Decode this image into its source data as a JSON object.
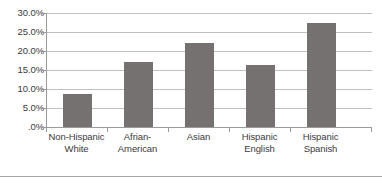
{
  "chart_data": {
    "type": "bar",
    "title": "",
    "subtitle": "",
    "xlabel": "",
    "ylabel": "",
    "categories": [
      "Non-Hispanic White",
      "Afrian-American",
      "Asian",
      "Hispanic English",
      "Hispanic Spanish"
    ],
    "category_lines": [
      [
        "Non-Hispanic",
        "White"
      ],
      [
        "Afrian-",
        "American"
      ],
      [
        "Asian",
        ""
      ],
      [
        "Hispanic",
        "English"
      ],
      [
        "Hispanic",
        "Spanish"
      ]
    ],
    "values": [
      8.7,
      17.0,
      22.0,
      16.2,
      27.5
    ],
    "value_labels": [
      "8.7%",
      "17.0%",
      "22.0%",
      "16.2%",
      "27.5%"
    ],
    "ylim": [
      0,
      30
    ],
    "ytick_values": [
      30,
      25,
      20,
      15,
      10,
      5,
      0
    ],
    "ytick_labels": [
      "30.0%",
      "25.0%",
      "20.0%",
      "15.0%",
      "10.0%",
      "5.0%",
      ".0%"
    ],
    "grid": true,
    "grid_axis": "y",
    "legend": false,
    "legend_position": "none",
    "bar_color": "#767171",
    "gridline_color": "#bfbfbf",
    "axis_color": "#9a9a9a",
    "text_color": "#3b3b3b",
    "background_color": "#ffffff"
  },
  "figure": {
    "border_rule_color": "#a6a6a6"
  }
}
